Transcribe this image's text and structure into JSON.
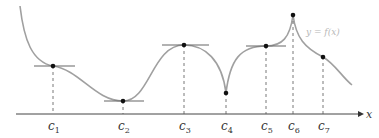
{
  "figure": {
    "curve_label": "y = f(x)",
    "axis_label": "x",
    "points": [
      {
        "label": "c",
        "sub": "1",
        "x": 53,
        "y": 66,
        "tangent": true
      },
      {
        "label": "c",
        "sub": "2",
        "x": 123,
        "y": 101,
        "tangent": true
      },
      {
        "label": "c",
        "sub": "3",
        "x": 184,
        "y": 45,
        "tangent": true
      },
      {
        "label": "c",
        "sub": "4",
        "x": 226,
        "y": 93,
        "tangent": false
      },
      {
        "label": "c",
        "sub": "5",
        "x": 266,
        "y": 46,
        "tangent": true
      },
      {
        "label": "c",
        "sub": "6",
        "x": 293,
        "y": 15,
        "tangent": false
      },
      {
        "label": "c",
        "sub": "7",
        "x": 323,
        "y": 57,
        "tangent": false
      }
    ],
    "colors": {
      "curve": "#a0a0a0",
      "axis": "#444444",
      "tangent": "#666666",
      "point": "#111111",
      "curve_label": "#b8b8b8"
    }
  }
}
